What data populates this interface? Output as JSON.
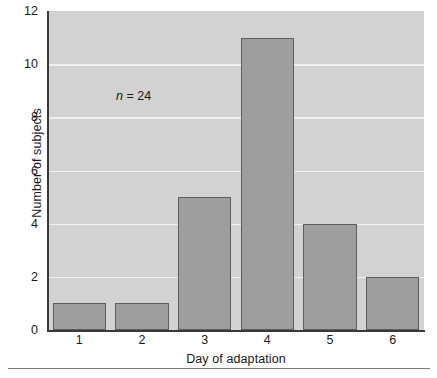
{
  "chart_data": {
    "type": "bar",
    "title": "",
    "subtitle": "",
    "xlabel": "Day of adaptation",
    "ylabel": "Number of subjects",
    "categories": [
      "1",
      "2",
      "3",
      "4",
      "5",
      "6"
    ],
    "values": [
      1,
      1,
      5,
      11,
      4,
      2
    ],
    "series": [
      {
        "name": "Number of subjects",
        "values": [
          1,
          1,
          5,
          11,
          4,
          2
        ]
      }
    ],
    "ylim": [
      0,
      12
    ],
    "yticks": [
      0,
      2,
      4,
      6,
      8,
      10,
      12
    ],
    "ytick_labels": [
      "0",
      "2",
      "4",
      "6",
      "8",
      "10",
      "12"
    ],
    "gridlines": [
      2,
      4,
      6,
      8,
      10
    ],
    "grid": true,
    "legend": false,
    "legend_position": "none",
    "annotations": [
      {
        "name": "sample-size",
        "italic_part": "n",
        "rest": " = 24",
        "full_text": "n = 24",
        "value": 24
      }
    ],
    "colors": {
      "bar_fill": "#9e9e9e",
      "bar_edge": "#5d5d5d",
      "plot_background": "#d2d2d2",
      "gridline": "#f0f0f0",
      "axis": "#3a3a3a",
      "text": "#1a1a1a",
      "figure_background": "#ffffff",
      "footer_rule": "#7c7c7c"
    }
  }
}
